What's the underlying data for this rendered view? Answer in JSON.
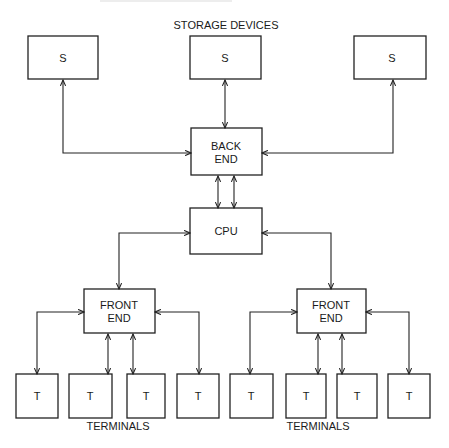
{
  "diagram": {
    "title_top": "STORAGE DEVICES",
    "caption_left": "TERMINALS",
    "caption_right": "TERMINALS",
    "storage": [
      {
        "label": "S"
      },
      {
        "label": "S"
      },
      {
        "label": "S"
      }
    ],
    "back_end": {
      "line1": "BACK",
      "line2": "END"
    },
    "cpu": {
      "label": "CPU"
    },
    "front_end_left": {
      "line1": "FRONT",
      "line2": "END"
    },
    "front_end_right": {
      "line1": "FRONT",
      "line2": "END"
    },
    "terminals_left": [
      {
        "label": "T"
      },
      {
        "label": "T"
      },
      {
        "label": "T"
      },
      {
        "label": "T"
      }
    ],
    "terminals_right": [
      {
        "label": "T"
      },
      {
        "label": "T"
      },
      {
        "label": "T"
      },
      {
        "label": "T"
      }
    ],
    "colors": {
      "line": "#222222",
      "background": "#ffffff"
    }
  }
}
